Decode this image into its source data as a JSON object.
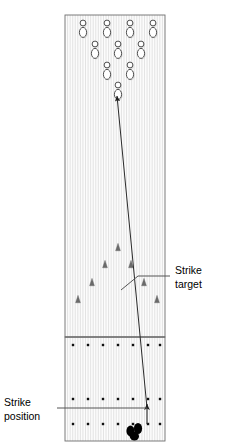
{
  "diagram": {
    "labels": {
      "strike_target_line1": "Strike",
      "strike_target_line2": "target",
      "strike_position_line1": "Strike",
      "strike_position_line2": "position"
    },
    "colors": {
      "background": "#ffffff",
      "lane_fill": "#fbfbfb",
      "lane_board_line": "#d8d8d8",
      "lane_border": "#6e6e6e",
      "pin_stroke": "#333333",
      "pin_fill": "#ffffff",
      "pin_shadow": "#c9c9c9",
      "ball_path": "#2b2b2b",
      "marker": "#6a6a6a",
      "dot": "#111111",
      "feet": "#000000",
      "leader": "#555555",
      "text": "#000000"
    },
    "geometry": {
      "lane_left": 65,
      "lane_right": 165,
      "lane_top": 15,
      "foul_line_y": 337,
      "approach_bottom": 441,
      "board_count": 39
    },
    "pins": {
      "count": 10,
      "rows": [
        {
          "row": 4,
          "y": 27,
          "xs": [
            83,
            107,
            130,
            153
          ]
        },
        {
          "row": 3,
          "y": 48,
          "xs": [
            95,
            118,
            141
          ]
        },
        {
          "row": 2,
          "y": 69,
          "xs": [
            107,
            130
          ]
        },
        {
          "row": 1,
          "y": 89,
          "xs": [
            118
          ]
        }
      ],
      "head_pin": {
        "x": 118,
        "y": 89
      }
    },
    "ball_path": {
      "start": {
        "x": 147,
        "y": 408
      },
      "end": {
        "x": 117,
        "y": 96
      },
      "has_arrowhead": true,
      "description": "Ball track from strike position to strike target at head pin"
    },
    "release_arrow": {
      "start": {
        "x": 147,
        "y": 424
      },
      "end": {
        "x": 147,
        "y": 404
      },
      "has_arrowhead": true
    },
    "lane_markers": {
      "count": 7,
      "shape": "triangle",
      "points": [
        {
          "x": 78,
          "y": 300
        },
        {
          "x": 92,
          "y": 283
        },
        {
          "x": 105,
          "y": 265
        },
        {
          "x": 118,
          "y": 248
        },
        {
          "x": 131,
          "y": 265
        },
        {
          "x": 144,
          "y": 283
        },
        {
          "x": 157,
          "y": 300
        }
      ]
    },
    "approach_dots": {
      "rows": 3,
      "per_row": 7,
      "row_y": [
        345,
        399,
        424
      ],
      "xs": [
        73,
        88,
        103,
        118,
        133,
        148,
        160
      ]
    },
    "feet": {
      "x": 136,
      "y": 430,
      "description": "Bowler foot position at strike position"
    },
    "leaders": {
      "strike_target": {
        "from": {
          "x": 121,
          "y": 290
        },
        "bend": {
          "x": 138,
          "y": 276
        },
        "to": {
          "x": 170,
          "y": 276
        }
      },
      "strike_position": {
        "from": {
          "x": 147,
          "y": 408
        },
        "to": {
          "x": 57,
          "y": 408
        }
      }
    },
    "text_positions": {
      "strike_target": {
        "x": 175,
        "y": 274
      },
      "strike_position": {
        "x": 4,
        "y": 406
      }
    }
  }
}
